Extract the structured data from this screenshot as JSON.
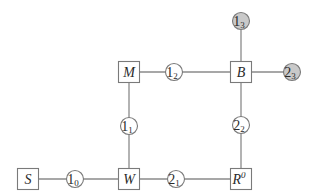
{
  "diagram": {
    "type": "node-graph",
    "colors": {
      "edge": "#8a8a8a",
      "node_border": "#7a7a7a",
      "node_fill": "#ffffff",
      "shaded_fill": "#c9c9c9",
      "text": "#2a2a2a"
    },
    "square_nodes": [
      {
        "id": "S",
        "label": "S",
        "sup": "",
        "x": 28,
        "y": 179
      },
      {
        "id": "W",
        "label": "W",
        "sup": "",
        "x": 129,
        "y": 179
      },
      {
        "id": "R",
        "label": "R",
        "sup": "0",
        "x": 241,
        "y": 179
      },
      {
        "id": "M",
        "label": "M",
        "sup": "",
        "x": 129,
        "y": 72
      },
      {
        "id": "B",
        "label": "B",
        "sup": "",
        "x": 241,
        "y": 72
      }
    ],
    "circle_nodes": [
      {
        "id": "1_0",
        "label": "1",
        "sub": "0",
        "x": 75,
        "y": 179,
        "shaded": false
      },
      {
        "id": "2_1",
        "label": "2",
        "sub": "1",
        "x": 176,
        "y": 179,
        "shaded": false
      },
      {
        "id": "1_1",
        "label": "1",
        "sub": "1",
        "x": 129,
        "y": 126,
        "shaded": false
      },
      {
        "id": "2_2",
        "label": "2",
        "sub": "2",
        "x": 241,
        "y": 125,
        "shaded": false
      },
      {
        "id": "1_2",
        "label": "1",
        "sub": "2",
        "x": 174,
        "y": 72,
        "shaded": false
      },
      {
        "id": "1_3",
        "label": "1",
        "sub": "3",
        "x": 241,
        "y": 21,
        "shaded": true
      },
      {
        "id": "2_3",
        "label": "2",
        "sub": "3",
        "x": 292,
        "y": 72,
        "shaded": true
      }
    ],
    "edges": [
      [
        "S",
        "1_0"
      ],
      [
        "1_0",
        "W"
      ],
      [
        "W",
        "2_1"
      ],
      [
        "2_1",
        "R"
      ],
      [
        "W",
        "1_1"
      ],
      [
        "1_1",
        "M"
      ],
      [
        "M",
        "1_2"
      ],
      [
        "1_2",
        "B"
      ],
      [
        "R",
        "2_2"
      ],
      [
        "2_2",
        "B"
      ],
      [
        "B",
        "1_3"
      ],
      [
        "B",
        "2_3"
      ]
    ]
  }
}
